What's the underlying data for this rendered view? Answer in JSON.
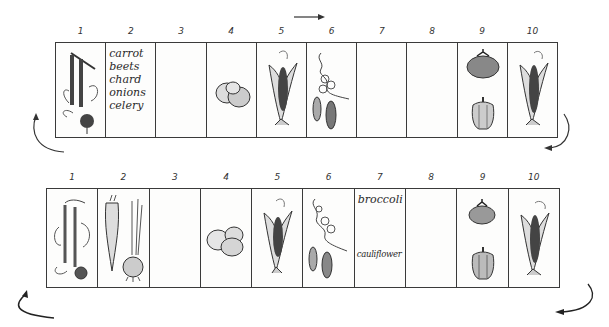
{
  "diagram": {
    "type": "crop rotation garden plan",
    "flow_direction": "left-to-right",
    "rows": [
      {
        "id": "top",
        "beds": [
          {
            "number": "1",
            "contents": [
              "beets",
              "chard"
            ],
            "icons": [
              "beet-chard-icon"
            ]
          },
          {
            "number": "2",
            "contents_text": [
              "carrot",
              "beets",
              "chard",
              "onions",
              "celery"
            ]
          },
          {
            "number": "3",
            "contents": []
          },
          {
            "number": "4",
            "contents": [
              "potatoes"
            ],
            "icons": [
              "potato-icon"
            ]
          },
          {
            "number": "5",
            "contents": [
              "corn"
            ],
            "icons": [
              "corn-icon"
            ]
          },
          {
            "number": "6",
            "contents": [
              "peas"
            ],
            "icons": [
              "pea-vine-icon"
            ]
          },
          {
            "number": "7",
            "contents": []
          },
          {
            "number": "8",
            "contents": []
          },
          {
            "number": "9",
            "contents": [
              "tomato",
              "pepper"
            ],
            "icons": [
              "tomato-icon",
              "pepper-icon"
            ]
          },
          {
            "number": "10",
            "contents": [
              "corn"
            ],
            "icons": [
              "corn-icon"
            ]
          }
        ]
      },
      {
        "id": "bottom",
        "beds": [
          {
            "number": "1",
            "contents": [
              "beets",
              "chard"
            ],
            "icons": [
              "beet-chard-icon"
            ]
          },
          {
            "number": "2",
            "contents": [
              "carrot",
              "onion"
            ],
            "icons": [
              "carrot-icon",
              "onion-icon"
            ]
          },
          {
            "number": "3",
            "contents": []
          },
          {
            "number": "4",
            "contents": [
              "potatoes"
            ],
            "icons": [
              "potato-icon"
            ]
          },
          {
            "number": "5",
            "contents": [
              "corn"
            ],
            "icons": [
              "corn-icon"
            ]
          },
          {
            "number": "6",
            "contents": [
              "peas"
            ],
            "icons": [
              "pea-vine-icon"
            ]
          },
          {
            "number": "7",
            "contents_text": [
              "broccoli",
              "cauliflower"
            ]
          },
          {
            "number": "8",
            "contents": []
          },
          {
            "number": "9",
            "contents": [
              "tomato",
              "pepper"
            ],
            "icons": [
              "tomato-icon",
              "pepper-icon"
            ]
          },
          {
            "number": "10",
            "contents": [
              "corn"
            ],
            "icons": [
              "corn-icon"
            ]
          }
        ]
      }
    ],
    "labels": {
      "top_bed2_lines": [
        "carrot",
        "beets",
        "chard",
        "onions",
        "celery"
      ],
      "bottom_bed7_top": "broccoli",
      "bottom_bed7_bottom": "cauliflower"
    },
    "numbers": [
      "1",
      "2",
      "3",
      "4",
      "5",
      "6",
      "7",
      "8",
      "9",
      "10"
    ],
    "ink_color": "#2a2a2a"
  }
}
